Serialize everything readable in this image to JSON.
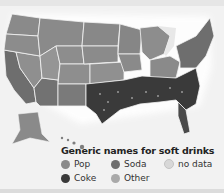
{
  "map": {
    "title": "Generic names for soft drinks",
    "region": "United States (counties)",
    "legend": [
      {
        "label": "Pop",
        "color": "#8a8a8a"
      },
      {
        "label": "Soda",
        "color": "#6e6e6e"
      },
      {
        "label": "no data",
        "color": "#d8d8d8"
      },
      {
        "label": "Coke",
        "color": "#3a3a3a"
      },
      {
        "label": "Other",
        "color": "#a9a9a9"
      }
    ],
    "colors": {
      "pop": "#8a8a8a",
      "soda": "#6e6e6e",
      "coke": "#3a3a3a",
      "other": "#a9a9a9",
      "no_data": "#d8d8d8",
      "border": "#f4f4f4",
      "background": "#f2f2f2"
    }
  }
}
